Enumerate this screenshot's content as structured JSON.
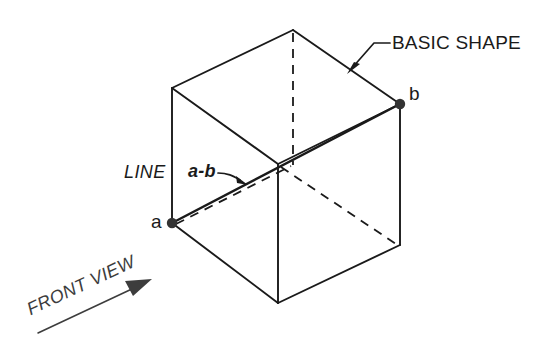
{
  "figure": {
    "title_text": "",
    "background_color": "#ffffff",
    "line_color": "#1a1a1a",
    "arrow_color": "#3d3d3d",
    "labels": {
      "basic_shape": "BASIC SHAPE",
      "point_b": "b",
      "point_a": "a",
      "line": "LINE",
      "line_ab": "a-b",
      "front_view": "FRONT VIEW"
    },
    "icons": {
      "leader_arrow_basic_shape": "arrow-icon",
      "leader_arrow_ab": "arrow-icon",
      "direction_arrow_front_view": "arrow-icon",
      "vertex_marker_a": "dot-icon",
      "vertex_marker_b": "dot-icon"
    },
    "geometry": {
      "shape": "cube",
      "projection": "isometric",
      "vertices": {
        "top_apex": [
          293,
          30
        ],
        "top_left": [
          172,
          88
        ],
        "top_right": [
          400,
          104
        ],
        "front_top": [
          278,
          164
        ],
        "bottom_left_a": [
          172,
          223
        ],
        "bottom_right": [
          400,
          245
        ],
        "front_bottom": [
          278,
          303
        ]
      },
      "solid_edges": [
        [
          [
            172,
            88
          ],
          [
            293,
            30
          ]
        ],
        [
          [
            293,
            30
          ],
          [
            400,
            104
          ]
        ],
        [
          [
            172,
            88
          ],
          [
            278,
            164
          ]
        ],
        [
          [
            278,
            164
          ],
          [
            400,
            104
          ]
        ],
        [
          [
            172,
            88
          ],
          [
            172,
            223
          ]
        ],
        [
          [
            400,
            104
          ],
          [
            400,
            245
          ]
        ],
        [
          [
            278,
            164
          ],
          [
            278,
            303
          ]
        ],
        [
          [
            172,
            223
          ],
          [
            278,
            303
          ]
        ],
        [
          [
            278,
            303
          ],
          [
            400,
            245
          ]
        ]
      ],
      "hidden_edges": [
        [
          [
            293,
            30
          ],
          [
            293,
            165
          ]
        ],
        [
          [
            278,
            164
          ],
          [
            400,
            245
          ]
        ],
        [
          [
            172,
            223
          ],
          [
            278,
            164
          ]
        ]
      ],
      "line_segment_ab": [
        [
          172,
          223
        ],
        [
          400,
          104
        ]
      ]
    }
  }
}
